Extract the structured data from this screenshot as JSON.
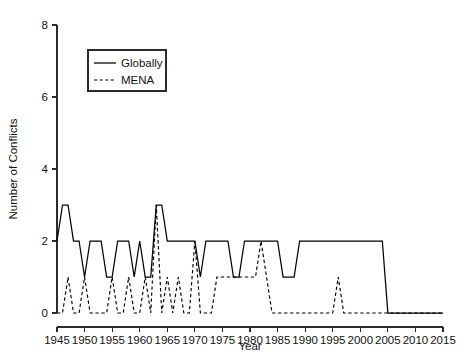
{
  "chart_data": {
    "type": "line",
    "title": "",
    "xlabel": "Year",
    "ylabel": "Number of Conflicts",
    "xlim": [
      1945,
      2015
    ],
    "ylim": [
      0,
      8
    ],
    "grid": false,
    "legend_position": "top-left-inside",
    "xticks": [
      1945,
      1950,
      1955,
      1960,
      1965,
      1970,
      1975,
      1980,
      1985,
      1990,
      1995,
      2000,
      2005,
      2010,
      2015
    ],
    "xticklabels": [
      "1945",
      "1950",
      "1955",
      "1960",
      "1965",
      "1970",
      "1975",
      "1980",
      "1985",
      "1990",
      "1995",
      "2000",
      "2005",
      "2010",
      "2015"
    ],
    "yticks": [
      0,
      2,
      4,
      6,
      8
    ],
    "yticklabels": [
      "0",
      "2",
      "4",
      "6",
      "8"
    ],
    "x": [
      1945,
      1946,
      1947,
      1948,
      1949,
      1950,
      1951,
      1952,
      1953,
      1954,
      1955,
      1956,
      1957,
      1958,
      1959,
      1960,
      1961,
      1962,
      1963,
      1964,
      1965,
      1966,
      1967,
      1968,
      1969,
      1970,
      1971,
      1972,
      1973,
      1974,
      1975,
      1976,
      1977,
      1978,
      1979,
      1980,
      1981,
      1982,
      1983,
      1984,
      1985,
      1986,
      1987,
      1988,
      1989,
      1990,
      1991,
      1992,
      1993,
      1994,
      1995,
      1996,
      1997,
      1998,
      1999,
      2000,
      2001,
      2002,
      2003,
      2004,
      2005,
      2006,
      2007,
      2008,
      2009,
      2010,
      2011,
      2012,
      2013,
      2014,
      2015
    ],
    "series": [
      {
        "name": "Globally",
        "style": "solid",
        "color": "#000000",
        "values": [
          2,
          3,
          3,
          2,
          2,
          1,
          2,
          2,
          2,
          1,
          1,
          2,
          2,
          2,
          1,
          2,
          1,
          1,
          3,
          3,
          2,
          2,
          2,
          2,
          2,
          2,
          1,
          2,
          2,
          2,
          2,
          2,
          1,
          1,
          2,
          2,
          2,
          2,
          2,
          2,
          2,
          1,
          1,
          1,
          2,
          2,
          2,
          2,
          2,
          2,
          2,
          2,
          2,
          2,
          2,
          2,
          2,
          2,
          2,
          2,
          0,
          0,
          0,
          0,
          0,
          0,
          0,
          0,
          0,
          0,
          0
        ]
      },
      {
        "name": "MENA",
        "style": "dashed",
        "color": "#000000",
        "values": [
          0,
          0,
          1,
          0,
          0,
          1,
          0,
          0,
          0,
          0,
          1,
          0,
          0,
          1,
          0,
          0,
          1,
          0,
          3,
          0,
          1,
          0,
          1,
          0,
          0,
          2,
          0,
          0,
          0,
          1,
          1,
          1,
          1,
          1,
          1,
          1,
          1,
          2,
          1,
          0,
          0,
          0,
          0,
          0,
          0,
          0,
          0,
          0,
          0,
          0,
          0,
          1,
          0,
          0,
          0,
          0,
          0,
          0,
          0,
          0,
          0,
          0,
          0,
          0,
          0,
          0,
          0,
          0,
          0,
          0,
          0
        ]
      }
    ],
    "legend_entries": [
      {
        "label": "Globally",
        "style": "solid"
      },
      {
        "label": "MENA",
        "style": "dashed"
      }
    ]
  }
}
